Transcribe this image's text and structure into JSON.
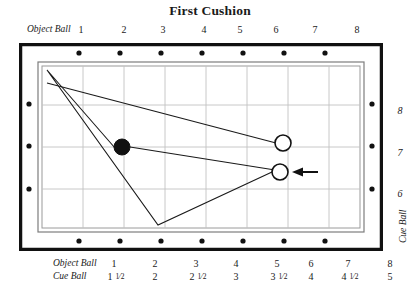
{
  "title": "First Cushion",
  "scales": {
    "top": {
      "label": "Object Ball",
      "label_x": 27,
      "values": [
        {
          "text": "1",
          "x": 81
        },
        {
          "text": "2",
          "x": 124
        },
        {
          "text": "3",
          "x": 163
        },
        {
          "text": "4",
          "x": 204
        },
        {
          "text": "5",
          "x": 240
        },
        {
          "text": "6",
          "x": 276
        },
        {
          "text": "7",
          "x": 315
        },
        {
          "text": "8",
          "x": 357
        }
      ]
    },
    "bottom_object_ball": {
      "label": "Object Ball",
      "label_x": 53,
      "values": [
        {
          "text": "1",
          "x": 114
        },
        {
          "text": "2",
          "x": 155
        },
        {
          "text": "3",
          "x": 196
        },
        {
          "text": "4",
          "x": 236
        },
        {
          "text": "5",
          "x": 277
        },
        {
          "text": "6",
          "x": 311
        },
        {
          "text": "7",
          "x": 348
        },
        {
          "text": "8",
          "x": 390
        }
      ]
    },
    "bottom_cue_ball": {
      "label": "Cue Ball",
      "label_x": 53,
      "values": [
        {
          "whole": "1",
          "num": "1",
          "den": "2",
          "x": 116
        },
        {
          "whole": "2",
          "x": 155
        },
        {
          "whole": "2",
          "num": "1",
          "den": "2",
          "x": 198
        },
        {
          "whole": "3",
          "x": 236
        },
        {
          "whole": "3",
          "num": "1",
          "den": "2",
          "x": 279
        },
        {
          "whole": "4",
          "x": 311
        },
        {
          "whole": "4",
          "num": "1",
          "den": "2",
          "x": 350
        },
        {
          "whole": "5",
          "x": 390
        }
      ]
    },
    "right": {
      "label": "Cue Ball",
      "label_x": 398,
      "label_y": 243,
      "values": [
        {
          "text": "8",
          "x": 393,
          "y": 110
        },
        {
          "text": "7",
          "x": 393,
          "y": 152
        },
        {
          "text": "6",
          "x": 393,
          "y": 193
        }
      ]
    }
  },
  "table": {
    "frame_color": "#111111",
    "cloth_color": "#ffffff",
    "grid_color": "#b9b9b9",
    "rail_line_color": "#7d7d7d",
    "diamond_color": "#111111",
    "outer": {
      "x": 1,
      "y": 1,
      "w": 362,
      "h": 206
    },
    "rail_inner": {
      "x": 19,
      "y": 19,
      "w": 326,
      "h": 170
    },
    "cloth": {
      "x": 23,
      "y": 23,
      "w": 318,
      "h": 162
    },
    "diamonds_top": [
      {
        "x": 60,
        "y": 10
      },
      {
        "x": 101,
        "y": 10
      },
      {
        "x": 142,
        "y": 10
      },
      {
        "x": 183,
        "y": 10
      },
      {
        "x": 224,
        "y": 10
      },
      {
        "x": 265,
        "y": 10
      },
      {
        "x": 306,
        "y": 10
      }
    ],
    "diamonds_bottom": [
      {
        "x": 60,
        "y": 198
      },
      {
        "x": 101,
        "y": 198
      },
      {
        "x": 142,
        "y": 198
      },
      {
        "x": 183,
        "y": 198
      },
      {
        "x": 224,
        "y": 198
      },
      {
        "x": 265,
        "y": 198
      },
      {
        "x": 306,
        "y": 198
      }
    ],
    "diamonds_left": [
      {
        "x": 10,
        "y": 61
      },
      {
        "x": 10,
        "y": 103
      },
      {
        "x": 10,
        "y": 146
      }
    ],
    "diamonds_right": [
      {
        "x": 353,
        "y": 61
      },
      {
        "x": 353,
        "y": 103
      },
      {
        "x": 353,
        "y": 146
      }
    ],
    "grid_vertical_x": [
      64,
      105,
      146,
      187,
      228,
      269,
      310
    ],
    "grid_horizontal_y": [
      62,
      104,
      146
    ]
  },
  "chart_data": {
    "type": "diagram",
    "title": "First Cushion",
    "balls": [
      {
        "name": "object-ball",
        "fill": "black",
        "x": 103,
        "y": 104,
        "r": 8
      },
      {
        "name": "cue-ball-target",
        "fill": "white",
        "x": 264,
        "y": 100,
        "r": 8
      },
      {
        "name": "cue-ball-start",
        "fill": "white",
        "x": 261,
        "y": 129,
        "r": 8
      }
    ],
    "paths": [
      {
        "name": "cue-path",
        "points": [
          [
            253,
            129
          ],
          [
            139,
            182
          ],
          [
            28,
            27
          ],
          [
            96,
            105
          ]
        ]
      },
      {
        "name": "aim-line",
        "points": [
          [
            111,
            104
          ],
          [
            256,
            127
          ]
        ]
      },
      {
        "name": "object-line",
        "points": [
          [
            28,
            40
          ],
          [
            257,
            100
          ]
        ]
      }
    ],
    "arrow": {
      "name": "shot-direction-arrow",
      "from": [
        298,
        129
      ],
      "to": [
        275,
        129
      ]
    }
  }
}
